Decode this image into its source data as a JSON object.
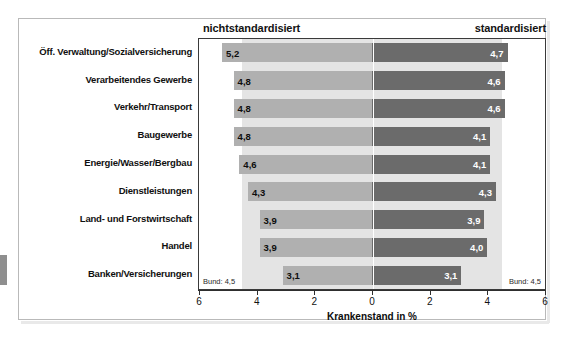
{
  "chart_data": {
    "type": "bar",
    "orientation": "horizontal-diverging",
    "title": "",
    "xlabel": "Krankenstand in %",
    "ylabel": "",
    "xlim": [
      6,
      6
    ],
    "xticks": [
      "6",
      "4",
      "2",
      "0",
      "2",
      "4",
      "6"
    ],
    "grid": false,
    "categories": [
      "Öff. Verwaltung/Sozialversicherung",
      "Verarbeitendes Gewerbe",
      "Verkehr/Transport",
      "Baugewerbe",
      "Energie/Wasser/Bergbau",
      "Dienstleistungen",
      "Land- und Forstwirtschaft",
      "Handel",
      "Banken/Versicherungen"
    ],
    "series": [
      {
        "name": "nichtstandardisiert",
        "side": "left",
        "color": "#b0b0b0",
        "values": [
          5.2,
          4.8,
          4.8,
          4.8,
          4.6,
          4.3,
          3.9,
          3.9,
          3.1
        ],
        "labels": [
          "5,2",
          "4,8",
          "4,8",
          "4,8",
          "4,6",
          "4,3",
          "3,9",
          "3,9",
          "3,1"
        ]
      },
      {
        "name": "standardisiert",
        "side": "right",
        "color": "#6b6b6b",
        "values": [
          4.7,
          4.6,
          4.6,
          4.1,
          4.1,
          4.3,
          3.9,
          4.0,
          3.1
        ],
        "labels": [
          "4,7",
          "4,6",
          "4,6",
          "4,1",
          "4,1",
          "4,3",
          "3,9",
          "4,0",
          "3,1"
        ]
      }
    ],
    "reference_band": {
      "label_left": "Bund: 4,5",
      "label_right": "Bund: 4,5",
      "value": 4.5,
      "color": "#e4e4e4"
    }
  },
  "header": {
    "left_label": "nichtstandardisiert",
    "right_label": "standardisiert"
  },
  "axis": {
    "title": "Krankenstand in %",
    "ticks": [
      "6",
      "4",
      "2",
      "0",
      "2",
      "4",
      "6"
    ]
  },
  "annotations": {
    "bund_left": "Bund: 4,5",
    "bund_right": "Bund: 4,5"
  }
}
